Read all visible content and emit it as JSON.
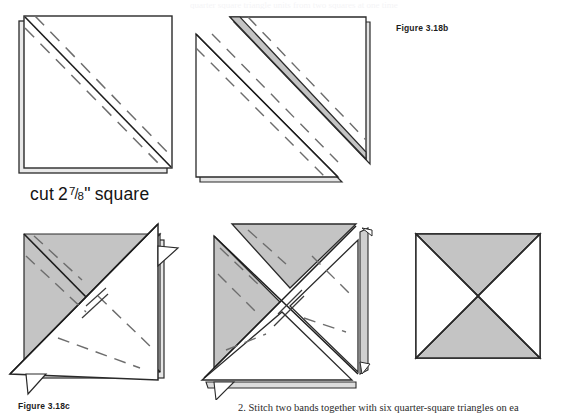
{
  "page": {
    "width": 562,
    "height": 414,
    "background": "#ffffff",
    "top_bleed_text": "quarter square triangle units from two squares at one time",
    "body_text": "2. Stitch two bands together with six quarter-square triangles on ea"
  },
  "captions": {
    "figure_b": "Figure 3.18b",
    "figure_c": "Figure 3.18c"
  },
  "labels": {
    "cut_prefix": "cut",
    "cut_whole": "2",
    "cut_numerator": "7",
    "cut_slash": "/",
    "cut_denominator": "8",
    "cut_inch_mark": "\"",
    "cut_suffix": "square",
    "cut_full": "cut 2 7/8\" square"
  },
  "colors": {
    "fabric_light": "#ffffff",
    "fabric_dark": "#c4c4c4",
    "outline": "#262626",
    "outline_soft": "#555555",
    "stitch_dash": "#6d6d6d",
    "layer_shadow": "#cfcfcf",
    "text": "#1a1a1a"
  },
  "diagrams": [
    {
      "id": "diagram-1",
      "name": "layered-square-with-stitch-lines",
      "description": "Two stacked fabric squares, right sides together, marked with a solid diagonal line corner to corner and a dashed sewing line on each side of it",
      "shape": "square",
      "layers": 2,
      "diagonal_lines": {
        "solid": 1,
        "dashed": 2
      },
      "fill": "#ffffff"
    },
    {
      "id": "diagram-2",
      "name": "stitched-and-cut-triangles",
      "description": "The stitched square cut apart on the drawn diagonal, producing two triangle units offset from one another; the seam allowance band along the hypotenuse is shaded",
      "shape": "two-offset-triangles",
      "layers": 2,
      "seam_band_fill": "#c4c4c4",
      "dashed_stitch_lines": 3
    },
    {
      "id": "diagram-3",
      "name": "paired-triangle-units-crossed",
      "description": "Two half-square triangle units placed right sides together with seams crossed, dark and light fabrics alternating, pinned for restitching",
      "shape": "crossed-square",
      "dark_quadrants": [
        "left",
        "top"
      ],
      "light_quadrants": [
        "right",
        "bottom"
      ],
      "dashed_stitch_lines": 4
    },
    {
      "id": "diagram-4",
      "name": "crossed-units-cut-diagonally",
      "description": "The crossed pair cut on the opposite diagonal, units rotated so dark and light triangles pinwheel, with seam allowance tabs extending past the edges",
      "shape": "pinwheel-offset",
      "dark_quadrants": [
        "top",
        "left"
      ],
      "light_quadrants": [
        "right",
        "bottom"
      ],
      "dashed_stitch_lines": 5
    },
    {
      "id": "diagram-5",
      "name": "finished-quarter-square-triangle-block",
      "description": "Completed quarter-square triangle block: top and bottom triangles dark, left and right triangles light",
      "shape": "quarter-square-block",
      "dark_quadrants": [
        "top",
        "bottom"
      ],
      "light_quadrants": [
        "left",
        "right"
      ]
    }
  ]
}
